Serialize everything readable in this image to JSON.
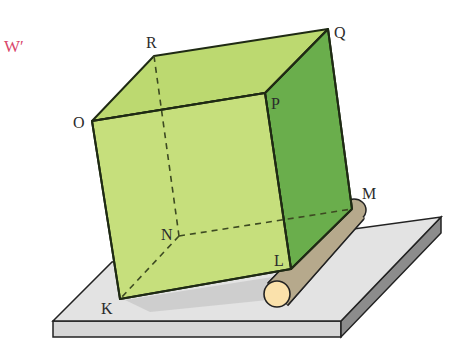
{
  "figure": {
    "title_label": "W′",
    "title_color": "#d9476b",
    "vertices": {
      "K": "K",
      "L": "L",
      "M": "M",
      "N": "N",
      "O": "O",
      "P": "P",
      "Q": "Q",
      "R": "R"
    },
    "colors": {
      "front_face": "#c6df7c",
      "top_face": "#bcd970",
      "right_face": "#6aae4c",
      "edge": "#1f2a14",
      "hidden_edge": "#3d4a22",
      "plate_top": "#e3e3e3",
      "plate_side": "#d6d6d6",
      "plate_right_side": "#8c8c8c",
      "cylinder_body": "#b6a98c",
      "cylinder_cap": "#fae1ab"
    }
  }
}
